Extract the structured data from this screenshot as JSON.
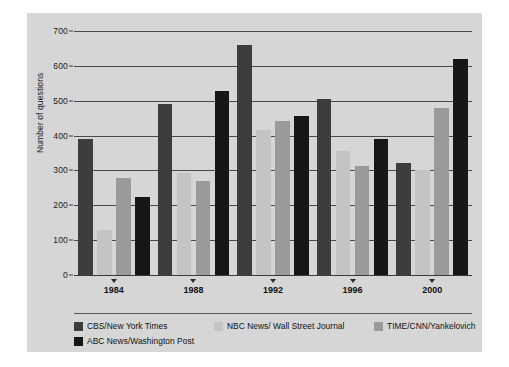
{
  "chart_data": {
    "type": "bar",
    "title": "",
    "xlabel": "",
    "ylabel": "Number of questions",
    "categories": [
      "1984",
      "1988",
      "1992",
      "1996",
      "2000"
    ],
    "ylim": [
      0,
      700
    ],
    "yticks": [
      0,
      100,
      200,
      300,
      400,
      500,
      600,
      700
    ],
    "ytick_labels": [
      "0",
      "100",
      "200",
      "300",
      "400",
      "500",
      "600",
      "700"
    ],
    "grid": true,
    "legend_position": "bottom-left",
    "series": [
      {
        "name": "CBS/New York Times",
        "color": "#3d3d3d",
        "values": [
          390,
          490,
          660,
          505,
          320
        ]
      },
      {
        "name": "NBC News/ Wall Street Journal",
        "color": "#c4c4c4",
        "values": [
          130,
          292,
          415,
          355,
          302
        ]
      },
      {
        "name": "TIME/CNN/Yankelovich",
        "color": "#9a9a9a",
        "values": [
          278,
          270,
          442,
          312,
          478
        ]
      },
      {
        "name": "ABC News/Washington Post",
        "color": "#161616",
        "values": [
          225,
          528,
          455,
          390,
          620
        ]
      }
    ]
  },
  "colors": {
    "figure_background": "#ffffff",
    "panel_background": "#d6d6d6",
    "gridline": "#4a4a4a",
    "axis": "#3a3a3a",
    "text": "#111111"
  }
}
